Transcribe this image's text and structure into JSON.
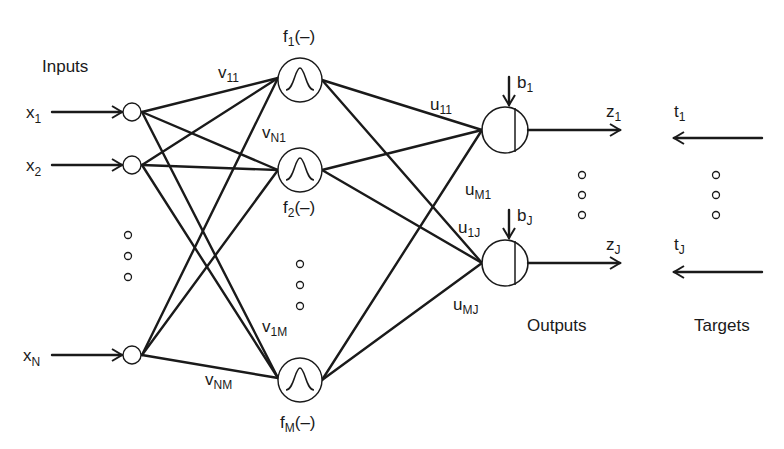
{
  "diagram": {
    "type": "neural-network",
    "group_labels": {
      "inputs": "Inputs",
      "outputs": "Outputs",
      "targets": "Targets"
    },
    "inputs": [
      {
        "base": "x",
        "sub": "1"
      },
      {
        "base": "x",
        "sub": "2"
      },
      {
        "base": "x",
        "sub": "N"
      }
    ],
    "hidden": [
      {
        "base": "f",
        "sub": "1",
        "suffix": "(–)"
      },
      {
        "base": "f",
        "sub": "2",
        "suffix": "(–)"
      },
      {
        "base": "f",
        "sub": "M",
        "suffix": "(–)"
      }
    ],
    "input_weights": [
      {
        "base": "v",
        "sub": "11"
      },
      {
        "base": "v",
        "sub": "N1"
      },
      {
        "base": "v",
        "sub": "1M"
      },
      {
        "base": "v",
        "sub": "NM"
      }
    ],
    "output_weights": [
      {
        "base": "u",
        "sub": "11"
      },
      {
        "base": "u",
        "sub": "M1"
      },
      {
        "base": "u",
        "sub": "1J"
      },
      {
        "base": "u",
        "sub": "MJ"
      }
    ],
    "biases": [
      {
        "base": "b",
        "sub": "1"
      },
      {
        "base": "b",
        "sub": "J"
      }
    ],
    "outputs": [
      {
        "base": "z",
        "sub": "1"
      },
      {
        "base": "z",
        "sub": "J"
      }
    ],
    "targets": [
      {
        "base": "t",
        "sub": "1"
      },
      {
        "base": "t",
        "sub": "J"
      }
    ],
    "hidden_activation_icon": "gaussian-bump-icon",
    "output_node_icon": "split-circle-icon",
    "ellipsis_icon": "vertical-dots-icon",
    "colors": {
      "ink": "#1a1a1a",
      "background": "#ffffff"
    }
  }
}
